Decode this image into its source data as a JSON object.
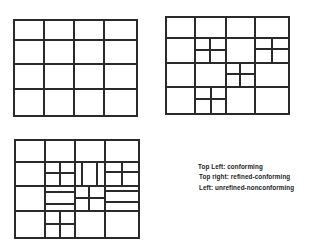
{
  "legend": {
    "top_left": "Top Left: conforming",
    "top_right": "Top right: refined-conforming",
    "left": "Left: unrefined-nonconforming"
  },
  "meshes": {
    "conforming": {
      "x": 14,
      "y": 20,
      "w": 123,
      "h": 96,
      "cols": [
        14,
        44,
        74,
        104,
        137
      ],
      "rows": [
        20,
        40,
        64,
        89,
        116
      ]
    },
    "refined_conforming": {
      "x": 166,
      "y": 17,
      "w": 123,
      "h": 97
    },
    "unrefined_nonconforming": {
      "x": 15,
      "y": 140,
      "w": 124,
      "h": 98
    }
  },
  "colors": {
    "line": "#2a2a2a",
    "background": "#ffffff",
    "text": "#1a1a1a"
  }
}
